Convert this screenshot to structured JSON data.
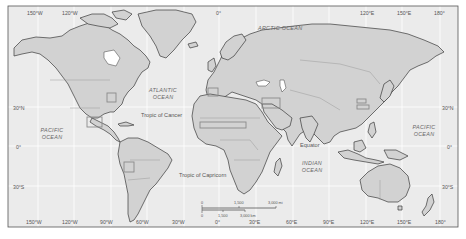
{
  "map": {
    "title": "World map",
    "colors": {
      "ocean": "#ebebeb",
      "land": "#d2d2d2",
      "land_stroke": "#3a3a3a",
      "border": "#9a9a9a",
      "graticule": "#ffffff",
      "frame": "#555555",
      "highlight_box": "#8a8a8a",
      "inland_water": "#ffffff",
      "text": "#555555"
    },
    "top_longitude_labels": [
      "150°W",
      "120°W",
      "0°",
      "120°E",
      "150°E",
      "180°"
    ],
    "bottom_longitude_labels": [
      "150°W",
      "120°W",
      "90°W",
      "60°W",
      "30°W",
      "0°",
      "30°E",
      "60°E",
      "90°E",
      "120°E",
      "150°E",
      "180°"
    ],
    "left_latitude_labels": [
      "30°N",
      "0°",
      "30°S"
    ],
    "right_latitude_labels": [
      "30°N",
      "0°",
      "30°S"
    ],
    "oceans": [
      {
        "name": "arctic",
        "line1": "ARCTIC OCEAN",
        "line2": ""
      },
      {
        "name": "atlantic",
        "line1": "ATLANTIC",
        "line2": "OCEAN"
      },
      {
        "name": "pacific-west",
        "line1": "PACIFIC",
        "line2": "OCEAN"
      },
      {
        "name": "pacific-east",
        "line1": "PACIFIC",
        "line2": "OCEAN"
      },
      {
        "name": "indian",
        "line1": "INDIAN",
        "line2": "OCEAN"
      }
    ],
    "reference_lines": {
      "tropic_of_cancer": "Tropic of Cancer",
      "equator": "Equator",
      "tropic_of_capricorn": "Tropic of Capricorn"
    },
    "scale_bar": {
      "miles_labels": [
        "0",
        "1,500",
        "3,000 mi"
      ],
      "km_labels": [
        "0",
        "1,500",
        "3,000 km"
      ]
    },
    "highlighted_regions": [
      "central-us",
      "mexico-central-america",
      "peru",
      "mediterranean-iberia",
      "sahel",
      "middle-east",
      "east-china"
    ]
  }
}
